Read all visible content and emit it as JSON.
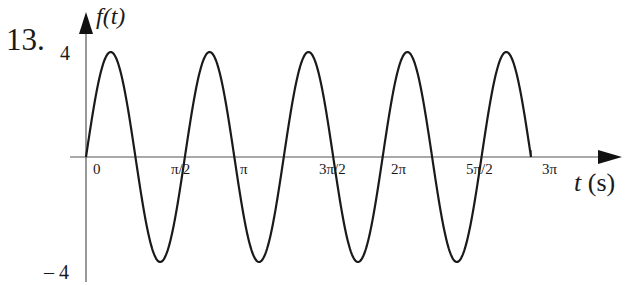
{
  "problem_number": "13.",
  "chart_data": {
    "type": "line",
    "title": "",
    "function": "f(t) = 4 sin(3t)",
    "xlabel": "t (s)",
    "ylabel": "f(t)",
    "x_ticks": [
      "0",
      "π/2",
      "π",
      "3π/2",
      "2π",
      "5π/2",
      "3π"
    ],
    "x_tick_values": [
      0,
      1.5708,
      3.1416,
      4.7124,
      6.2832,
      7.854,
      9.4248
    ],
    "y_ticks": [
      "4",
      "– 4"
    ],
    "y_tick_values": [
      4,
      -4
    ],
    "xlim": [
      0,
      9.4248
    ],
    "ylim": [
      -4,
      4
    ],
    "amplitude": 4,
    "angular_frequency": 3,
    "period": "2π/3",
    "grid": false,
    "legend": null,
    "series": [
      {
        "name": "f(t)",
        "x": [
          0,
          0.5236,
          1.0472,
          1.5708,
          2.0944,
          2.618,
          3.1416,
          3.6652,
          4.1888,
          4.7124,
          5.236,
          5.7596,
          6.2832,
          6.8068,
          7.3304,
          7.854,
          8.3776,
          8.9012,
          9.4248
        ],
        "values": [
          0,
          4,
          0,
          -4,
          0,
          4,
          0,
          -4,
          0,
          4,
          0,
          -4,
          0,
          4,
          0,
          -4,
          0,
          4,
          0
        ]
      }
    ]
  },
  "labels": {
    "ylabel_text": "f(t)",
    "xlabel_var": "t",
    "xlabel_unit": " (s)",
    "ytick_top": "4",
    "ytick_bottom": "– 4",
    "xticks": [
      "0",
      "π/2",
      "π",
      "3π/2",
      "2π",
      "5π/2",
      "3π"
    ]
  },
  "colors": {
    "curve": "#1a1a1a",
    "axis": "#555555",
    "background": "#ffffff"
  }
}
